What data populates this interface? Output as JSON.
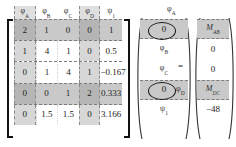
{
  "equation": {
    "type": "matrix-equation",
    "equals_sign": "=",
    "matrix_headers": [
      {
        "base": "φ",
        "sub": "A",
        "shaded": true
      },
      {
        "base": "φ",
        "sub": "B",
        "shaded": false
      },
      {
        "base": "φ",
        "sub": "C",
        "shaded": false
      },
      {
        "base": "φ",
        "sub": "D",
        "shaded": true
      },
      {
        "base": "ψ",
        "sub": "1",
        "shaded": false
      }
    ],
    "matrix_rows": [
      {
        "shaded": true,
        "values": [
          "2",
          "1",
          "0",
          "0",
          "1"
        ]
      },
      {
        "shaded": false,
        "values": [
          "1",
          "4",
          "1",
          "0",
          "0.5"
        ]
      },
      {
        "shaded": false,
        "values": [
          "0",
          "1",
          "4",
          "1",
          "−0.167"
        ]
      },
      {
        "shaded": true,
        "values": [
          "0",
          "0",
          "1",
          "2",
          "0.333"
        ]
      },
      {
        "shaded": false,
        "values": [
          "0",
          "1.5",
          "1.5",
          "0",
          "3.166"
        ]
      }
    ],
    "unknown_vector": [
      {
        "text": "0",
        "base": "",
        "sub": "",
        "circled": true,
        "shaded": true
      },
      {
        "text": "",
        "base": "φ",
        "sub": "B",
        "circled": false,
        "shaded": false
      },
      {
        "text": "",
        "base": "φ",
        "sub": "C",
        "circled": false,
        "shaded": false
      },
      {
        "text": "0",
        "base": "",
        "sub": "",
        "circled": true,
        "shaded": true
      },
      {
        "text": "",
        "base": "ψ",
        "sub": "1",
        "circled": false,
        "shaded": false
      }
    ],
    "rhs_vector": [
      {
        "base": "M",
        "sub": "AB",
        "italic": true,
        "shaded": true
      },
      {
        "base": "0",
        "sub": "",
        "italic": false,
        "shaded": false
      },
      {
        "base": "0",
        "sub": "",
        "italic": false,
        "shaded": false
      },
      {
        "base": "M",
        "sub": "DC",
        "italic": true,
        "shaded": true
      },
      {
        "base": "−48",
        "sub": "",
        "italic": false,
        "shaded": false
      }
    ],
    "callout_labels": [
      {
        "base": "φ",
        "sub": "A",
        "position": "above-top-circled-zero"
      },
      {
        "base": "φ",
        "sub": "D",
        "position": "right-of-bottom-circled-zero"
      }
    ],
    "colors": {
      "shade_band": "#c9c9c9",
      "column_shade": "#969696",
      "bracket": "#111111",
      "dash_border": "#7d7d7d",
      "text": "#222222",
      "background": "#ffffff"
    }
  }
}
